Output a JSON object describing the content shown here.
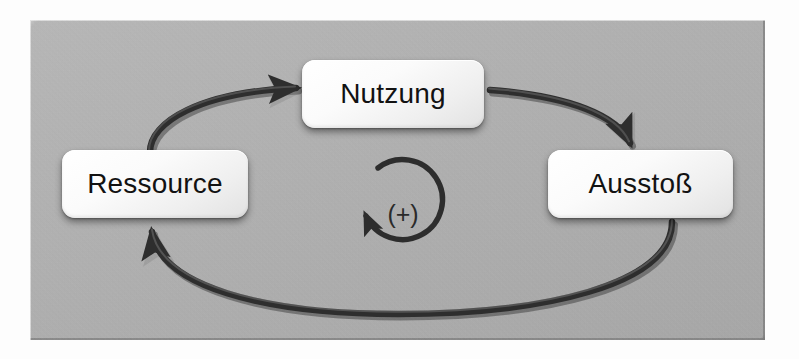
{
  "diagram": {
    "type": "causal-loop-diagram",
    "loop_polarity": "(+)",
    "loop_direction": "counterclockwise-marker",
    "panel_color": "#b2b2b2",
    "node_color": "#f4f4f4",
    "arrow_color": "#2e2e2e",
    "text_color": "#121212",
    "nodes": [
      {
        "id": "ressource",
        "label": "Ressource",
        "position": "left"
      },
      {
        "id": "nutzung",
        "label": "Nutzung",
        "position": "top-center"
      },
      {
        "id": "ausstoss",
        "label": "Ausstoß",
        "position": "right"
      }
    ],
    "edges": [
      {
        "id": "ressource-to-nutzung",
        "from": "Ressource",
        "to": "Nutzung",
        "shape": "curved-arrow"
      },
      {
        "id": "nutzung-to-ausstoss",
        "from": "Nutzung",
        "to": "Ausstoß",
        "shape": "curved-arrow"
      },
      {
        "id": "ausstoss-to-ressource",
        "from": "Ausstoß",
        "to": "Ressource",
        "shape": "curved-arrow"
      }
    ],
    "center_marker": {
      "symbol": "(+)",
      "icon": "circular-arrow-icon"
    }
  }
}
